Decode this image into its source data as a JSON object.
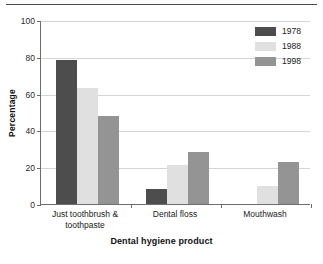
{
  "chart_data": {
    "type": "bar",
    "title": "",
    "subtitle": "",
    "xlabel": "Dental hygiene product",
    "ylabel": "Percentage",
    "categories": [
      "Just toothbrush & toothpaste",
      "Dental floss",
      "Mouthwash"
    ],
    "series": [
      {
        "name": "1978",
        "color": "#4d4d4d",
        "values": [
          78,
          8,
          0
        ]
      },
      {
        "name": "1988",
        "color": "#e0e0e0",
        "values": [
          63,
          21,
          10
        ]
      },
      {
        "name": "1998",
        "color": "#949494",
        "values": [
          48,
          28,
          23
        ]
      }
    ],
    "ylim": [
      0,
      100
    ],
    "yticks": [
      0,
      20,
      40,
      60,
      80,
      100
    ],
    "ytick_labels": [
      "0",
      "20",
      "40",
      "60",
      "80",
      "100"
    ],
    "grid": "horizontal",
    "legend_position": "top-right",
    "axis_color": "#6d6d6d",
    "grid_color": "#d5d5d5"
  },
  "legend": {
    "entries": [
      {
        "label": "1978"
      },
      {
        "label": "1988"
      },
      {
        "label": "1998"
      }
    ]
  }
}
